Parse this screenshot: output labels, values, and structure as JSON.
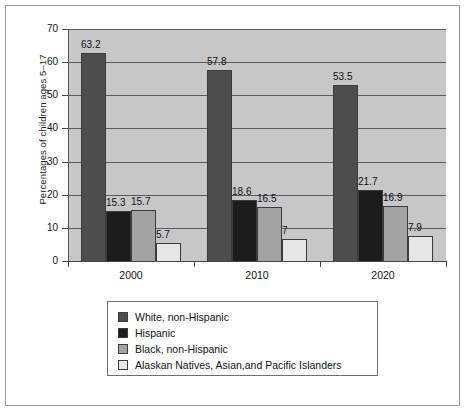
{
  "chart_data": {
    "type": "bar",
    "title": "",
    "subtitle": "",
    "xlabel": "",
    "ylabel": "Percentages of children ages 5–17",
    "categories": [
      "2000",
      "2010",
      "2020"
    ],
    "ylim": [
      0,
      70
    ],
    "yticks": [
      0,
      10,
      20,
      30,
      40,
      50,
      60,
      70
    ],
    "ytick_labels": [
      "0",
      "10",
      "20",
      "30",
      "40",
      "50",
      "60",
      "70"
    ],
    "grid": true,
    "legend_position": "bottom",
    "series": [
      {
        "name": "White, non-Hispanic",
        "color": "#4d4d4d",
        "values": [
          63.2,
          57.8,
          53.5
        ],
        "value_labels": [
          "63.2",
          "57.8",
          "53.5"
        ]
      },
      {
        "name": "Hispanic",
        "color": "#1c1c1c",
        "values": [
          15.3,
          18.6,
          21.7
        ],
        "value_labels": [
          "15.3",
          "18.6",
          "21.7"
        ]
      },
      {
        "name": "Black, non-Hispanic",
        "color": "#a3a3a3",
        "values": [
          15.7,
          16.5,
          16.9
        ],
        "value_labels": [
          "15.7",
          "16.5",
          "16.9"
        ]
      },
      {
        "name": "Alaskan Natives, Asian,and Pacific Islanders",
        "color": "#e6e6e6",
        "values": [
          5.7,
          7,
          7.9
        ],
        "value_labels": [
          "5.7",
          "7",
          "7.9"
        ]
      }
    ],
    "plot_background": "#c7c7c7",
    "gridline_color": "#5a5a5f",
    "axis_color": "#45454a"
  }
}
